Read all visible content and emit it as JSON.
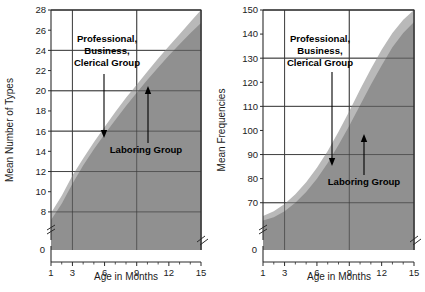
{
  "figure": {
    "background": "#ffffff",
    "band_light_color": "#b9b9b9",
    "band_dark_color": "#909090",
    "axis_color": "#2b2b2b"
  },
  "chart_data": [
    {
      "id": "left",
      "type": "area",
      "title": "",
      "xlabel": "Age in Months",
      "ylabel": "Mean Number of Types",
      "xlim": [
        1,
        15
      ],
      "ylim": [
        7,
        28
      ],
      "y_axis_break": true,
      "y_zero_label": "0",
      "grid": true,
      "xticks": [
        1,
        3,
        6,
        9,
        12,
        15
      ],
      "xticklabels": [
        "1",
        "3",
        "6",
        "9",
        "12",
        "15"
      ],
      "x_minor_ticks": [
        2,
        4,
        5,
        7,
        8,
        10,
        11,
        13,
        14
      ],
      "yticks": [
        8,
        10,
        12,
        14,
        16,
        18,
        20,
        22,
        24,
        26,
        28
      ],
      "yticklabels": [
        "8",
        "10",
        "12",
        "14",
        "16",
        "18",
        "20",
        "22",
        "24",
        "26",
        "28"
      ],
      "y_gridlines": [
        8,
        12,
        16,
        20,
        24,
        28
      ],
      "x_gridlines": [
        3,
        9,
        15
      ],
      "series": [
        {
          "name": "Professional, Business, Clerical Group",
          "fill": "#b9b9b9",
          "x": [
            1,
            2,
            3,
            4,
            5,
            6,
            7,
            8,
            9,
            10,
            11,
            12,
            13,
            14,
            15
          ],
          "values": [
            7.9,
            9.6,
            11.6,
            13.3,
            14.9,
            16.4,
            17.9,
            19.3,
            20.6,
            21.9,
            23.2,
            24.4,
            25.6,
            26.8,
            28.0
          ]
        },
        {
          "name": "Laboring Group",
          "fill": "#909090",
          "x": [
            1,
            2,
            3,
            4,
            5,
            6,
            7,
            8,
            9,
            10,
            11,
            12,
            13,
            14,
            15
          ],
          "values": [
            7.2,
            8.8,
            10.8,
            12.6,
            14.2,
            15.7,
            17.1,
            18.5,
            19.8,
            21.1,
            22.3,
            23.5,
            24.6,
            25.7,
            26.7
          ]
        }
      ],
      "annotations": [
        {
          "name": "professional-label",
          "lines": [
            "Professional,",
            "Business,",
            "Clerical Group"
          ],
          "arrow": "down"
        },
        {
          "name": "laboring-label",
          "lines": [
            "Laboring Group"
          ],
          "arrow": "up"
        }
      ]
    },
    {
      "id": "right",
      "type": "area",
      "title": "",
      "xlabel": "Age in Months",
      "ylabel": "Mean Frequencies",
      "xlim": [
        1,
        15
      ],
      "ylim": [
        62,
        150
      ],
      "y_axis_break": true,
      "y_zero_label": "0",
      "grid": true,
      "xticks": [
        1,
        3,
        6,
        9,
        12,
        15
      ],
      "xticklabels": [
        "1",
        "3",
        "6",
        "9",
        "12",
        "15"
      ],
      "x_minor_ticks": [
        2,
        4,
        5,
        7,
        8,
        10,
        11,
        13,
        14
      ],
      "yticks": [
        70,
        80,
        90,
        100,
        110,
        120,
        130,
        140,
        150
      ],
      "yticklabels": [
        "70",
        "80",
        "90",
        "100",
        "110",
        "120",
        "130",
        "140",
        "150"
      ],
      "y_gridlines": [
        70,
        90,
        110,
        130,
        150
      ],
      "x_gridlines": [
        3,
        9,
        15
      ],
      "series": [
        {
          "name": "Professional, Business, Clerical Group",
          "fill": "#b9b9b9",
          "x": [
            1,
            2,
            3,
            4,
            5,
            6,
            7,
            8,
            9,
            10,
            11,
            12,
            13,
            14,
            15
          ],
          "values": [
            64.5,
            66.5,
            69.5,
            73.5,
            78.5,
            84.5,
            91.5,
            99.5,
            108.0,
            117.0,
            125.5,
            133.5,
            140.5,
            146.0,
            150.0
          ]
        },
        {
          "name": "Laboring Group",
          "fill": "#909090",
          "x": [
            1,
            2,
            3,
            4,
            5,
            6,
            7,
            8,
            9,
            10,
            11,
            12,
            13,
            14,
            15
          ],
          "values": [
            62.6,
            64.0,
            66.5,
            70.0,
            74.5,
            80.0,
            86.5,
            94.0,
            102.0,
            110.5,
            119.0,
            127.0,
            134.5,
            140.5,
            145.0
          ]
        }
      ],
      "annotations": [
        {
          "name": "professional-label",
          "lines": [
            "Professional,",
            "Business,",
            "Clerical Group"
          ],
          "arrow": "down"
        },
        {
          "name": "laboring-label",
          "lines": [
            "Laboring Group"
          ],
          "arrow": "up"
        }
      ]
    }
  ]
}
